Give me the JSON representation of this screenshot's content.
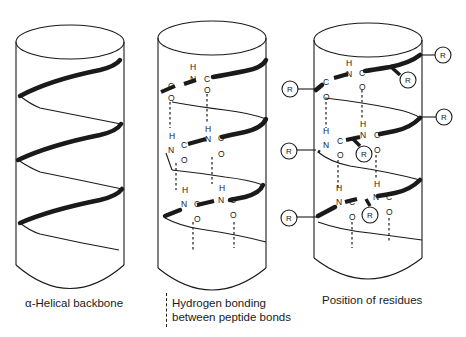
{
  "figure": {
    "panels": [
      {
        "id": "backbone",
        "caption": "α-Helical backbone"
      },
      {
        "id": "hbonds",
        "caption_line1": "Hydrogen bonding",
        "caption_line2": "between peptide bonds",
        "legend_symbol": "dashed-line"
      },
      {
        "id": "residues",
        "caption": "Position of residues"
      }
    ],
    "atoms": {
      "H": "H",
      "N": "N",
      "C": "C",
      "O": "O"
    },
    "residue_label": "R",
    "colors": {
      "line": "#1a1a1a",
      "background": "#ffffff"
    }
  }
}
